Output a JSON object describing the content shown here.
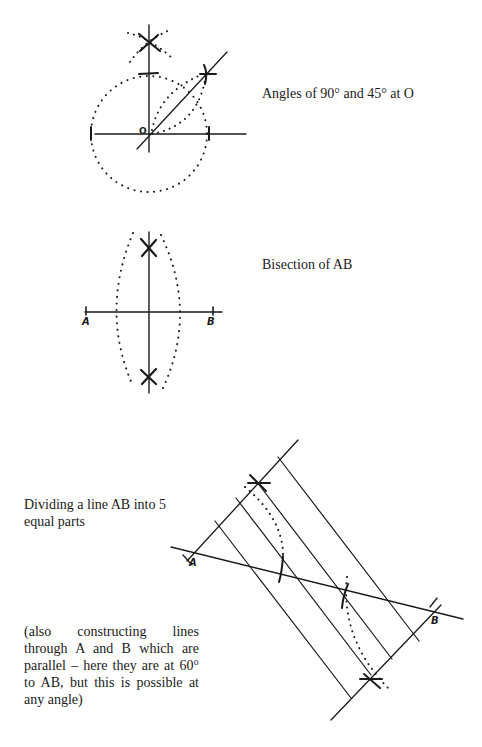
{
  "figures": [
    {
      "id": "angles",
      "caption": "Angles of 90° and 45° at O",
      "point_labels": [
        "O"
      ]
    },
    {
      "id": "bisection",
      "caption": "Bisection of AB",
      "point_labels": [
        "A",
        "B"
      ]
    },
    {
      "id": "division",
      "caption": "Dividing a line AB into 5 equal parts",
      "note": "(also constructing lines through A and B which are parallel – here they are at 60° to AB, but this is possible at any angle)",
      "point_labels": [
        "A",
        "B"
      ],
      "equal_parts": 5,
      "parallel_angle_deg": 60
    }
  ],
  "colors": {
    "ink": "#1a1a1a",
    "background": "#ffffff"
  }
}
